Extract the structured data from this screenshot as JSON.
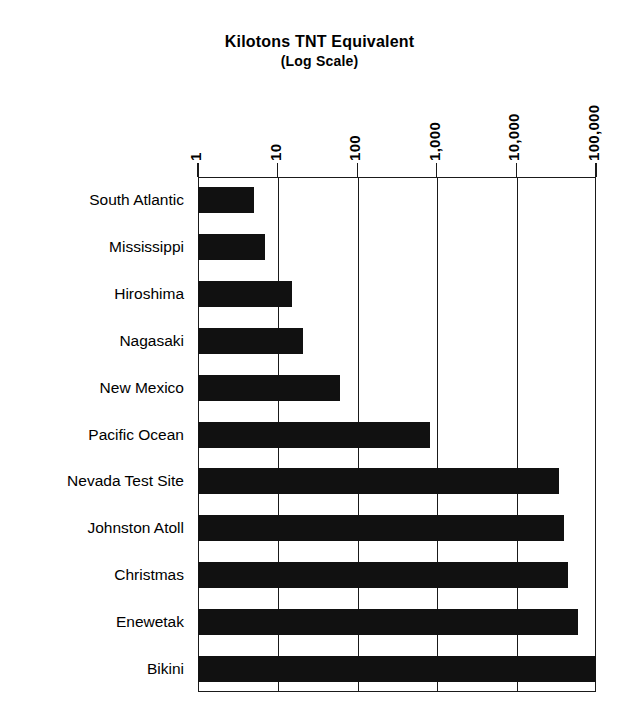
{
  "chart": {
    "title": "Kilotons TNT Equivalent",
    "subtitle": "(Log Scale)"
  },
  "axis": {
    "ticks": [
      {
        "label": "1",
        "value": 1
      },
      {
        "label": "10",
        "value": 10
      },
      {
        "label": "100",
        "value": 100
      },
      {
        "label": "1,000",
        "value": 1000
      },
      {
        "label": "10,000",
        "value": 10000
      },
      {
        "label": "100,000",
        "value": 100000
      }
    ]
  },
  "colors": {
    "bar": "#111111",
    "axis": "#1a1a1a",
    "background": "#ffffff"
  },
  "chart_data": {
    "type": "bar",
    "orientation": "horizontal",
    "title": "Kilotons TNT Equivalent",
    "subtitle": "(Log Scale)",
    "xlabel": "Kilotons TNT Equivalent",
    "ylabel": "",
    "xscale": "log",
    "xlim": [
      1,
      100000
    ],
    "xticks": [
      1,
      10,
      100,
      1000,
      10000,
      100000
    ],
    "xticklabels": [
      "1",
      "10",
      "100",
      "1,000",
      "10,000",
      "100,000"
    ],
    "grid": true,
    "grid_axis": "x",
    "legend": false,
    "categories": [
      "South Atlantic",
      "Mississippi",
      "Hiroshima",
      "Nagasaki",
      "New Mexico",
      "Pacific Ocean",
      "Nevada Test Site",
      "Johnston Atoll",
      "Christmas",
      "Enewetak",
      "Bikini"
    ],
    "values": [
      5,
      7,
      15,
      21,
      60,
      820,
      34000,
      40000,
      44000,
      60000,
      100000
    ]
  }
}
